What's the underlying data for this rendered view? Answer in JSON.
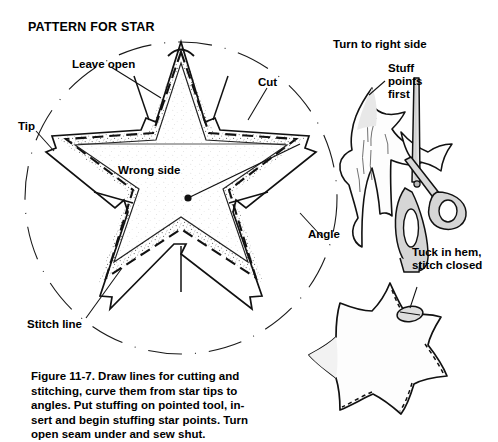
{
  "figure": {
    "title": "PATTERN FOR STAR",
    "caption": "Figure 11-7. Draw lines for cutting and\nstitching, curve them from star tips to\nangles. Put stuffing on pointed tool, in-\nsert and begin stuffing star points. Turn\nopen seam under and sew shut.",
    "caption_number": "Figure 11-7."
  },
  "labels": {
    "leave_open": "Leave open",
    "cut": "Cut",
    "tip": "Tip",
    "wrong_side": "Wrong side",
    "angle": "Angle",
    "stitch_line": "Stitch line",
    "turn_to_right_side": "Turn to right side",
    "stuff_points_first": "Stuff\npoints\nfirst",
    "tuck_in_hem": "Tuck in hem,\nstitch closed"
  },
  "panels": [
    {
      "id": "pattern-panel",
      "name": "star-pattern-diagram",
      "description": "Five pointed star cut pattern inside a dashed circle with seam allowance, stitch line and cut line"
    },
    {
      "id": "stuffing-panel",
      "name": "stuffing-tool-diagram",
      "description": "Fabric star turned right side out with scissors used as a pointed stuffing tool"
    },
    {
      "id": "finished-panel",
      "name": "finished-star-diagram",
      "description": "Finished stuffed star with the open seam tucked in and stitched closed"
    }
  ],
  "colors": {
    "ink": "#000000",
    "paper": "#ffffff",
    "stipple": "#9a9a9a",
    "shade": "#d8d8d8",
    "light_shade": "#ededed"
  }
}
